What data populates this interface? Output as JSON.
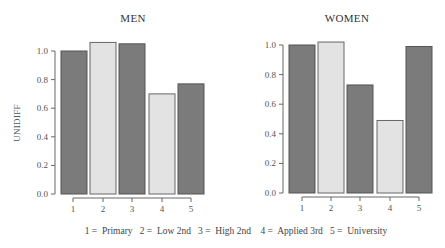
{
  "chart_data": [
    {
      "type": "bar",
      "title": "MEN",
      "xlabel": "",
      "ylabel": "UNIDIFF",
      "ylim": [
        0,
        1.0
      ],
      "yticks": [
        "0.0",
        "0.2",
        "0.4",
        "0.6",
        "0.8",
        "1.0"
      ],
      "categories": [
        "1",
        "2",
        "3",
        "4",
        "5"
      ],
      "values": [
        1.0,
        1.06,
        1.05,
        0.7,
        0.77
      ],
      "bar_shades": [
        "dark",
        "light",
        "dark",
        "light",
        "dark"
      ],
      "grid": false
    },
    {
      "type": "bar",
      "title": "WOMEN",
      "xlabel": "",
      "ylabel": "",
      "ylim": [
        0,
        1.0
      ],
      "yticks": [
        "0.0",
        "0.2",
        "0.4",
        "0.6",
        "0.8",
        "1.0"
      ],
      "categories": [
        "1",
        "2",
        "3",
        "4",
        "5"
      ],
      "values": [
        1.0,
        1.02,
        0.73,
        0.49,
        0.99
      ],
      "bar_shades": [
        "dark",
        "light",
        "dark",
        "light",
        "dark"
      ],
      "grid": false
    }
  ],
  "legend": {
    "items": [
      {
        "code": "1",
        "label": "Primary"
      },
      {
        "code": "2",
        "label": "Low 2nd"
      },
      {
        "code": "3",
        "label": "High 2nd"
      },
      {
        "code": "4",
        "label": "Applied 3rd"
      },
      {
        "code": "5",
        "label": "University"
      }
    ],
    "text": "1 =  Primary   2 =  Low 2nd   3 =  High 2nd    4 =  Applied 3rd   5 =  University"
  },
  "colors": {
    "dark_bar": "#7b7b7b",
    "light_bar": "#e3e3e3",
    "axis": "#666666"
  }
}
